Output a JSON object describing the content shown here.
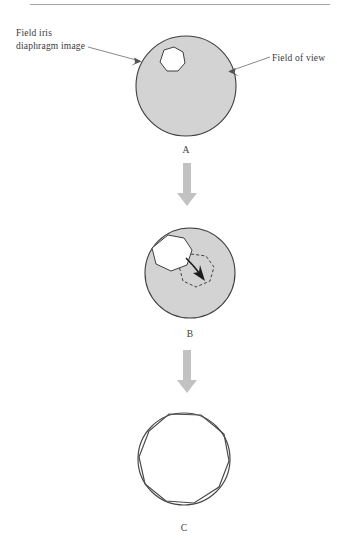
{
  "figure": {
    "background_color": "#ffffff",
    "disc_fill_color": "#d3d3d3",
    "disc_stroke_color": "#3f3f3f",
    "flow_arrow_color": "#c2c2c2",
    "top_rule_color": "#9a9a9a"
  },
  "annotations": {
    "field_iris": {
      "line1": "Field iris",
      "line2": "diaphragm image"
    },
    "field_of_view": {
      "text": "Field of view"
    }
  },
  "panels": [
    {
      "id": "panel-a",
      "letter": "A",
      "description": "Field of view disc with small field iris diaphragm image offset to the upper left",
      "disc": {
        "cx": 186,
        "cy": 86,
        "r": 50
      },
      "iris_polygon_sides": 7
    },
    {
      "id": "panel-b",
      "letter": "B",
      "description": "Field iris diaphragm image being moved toward the center of the field of view",
      "disc": {
        "cx": 190,
        "cy": 273,
        "r": 45
      },
      "iris_polygon_sides": 7,
      "target_polygon_sides": 7,
      "motion_arrow": "curved arrow pointing down and to the right"
    },
    {
      "id": "panel-c",
      "letter": "C",
      "description": "Field iris diaphragm image opened until it just circumscribes the field of view",
      "disc": {
        "cx": 184,
        "cy": 459,
        "r": 46
      },
      "iris_polygon_sides": 9
    }
  ],
  "flow_arrows": [
    {
      "id": "arrow-a-to-b",
      "from": "A",
      "to": "B",
      "direction": "down"
    },
    {
      "id": "arrow-b-to-c",
      "from": "B",
      "to": "C",
      "direction": "down"
    }
  ]
}
